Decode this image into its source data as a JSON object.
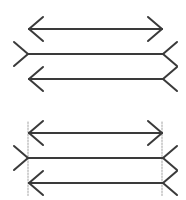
{
  "figure": {
    "stroke_color": "#3a3a3a",
    "guide_color": "#8a8a8a",
    "groups": [
      {
        "name": "illusion",
        "guides": false,
        "lines": [
          {
            "y": 29,
            "x1": 29,
            "x2": 162,
            "left": "arrow-out",
            "right": "arrow-out"
          },
          {
            "y": 54,
            "x1": 28,
            "x2": 163,
            "left": "fin-in",
            "right": "fin-in"
          },
          {
            "y": 79,
            "x1": 29,
            "x2": 163,
            "left": "arrow-out",
            "right": "fin-in"
          }
        ]
      },
      {
        "name": "reveal",
        "guides": true,
        "guide_x": [
          28,
          162
        ],
        "guide_y": [
          122,
          196
        ],
        "lines": [
          {
            "y": 133,
            "x1": 29,
            "x2": 162,
            "left": "arrow-out",
            "right": "arrow-out"
          },
          {
            "y": 158,
            "x1": 28,
            "x2": 163,
            "left": "fin-in",
            "right": "fin-in"
          },
          {
            "y": 183,
            "x1": 29,
            "x2": 163,
            "left": "arrow-out",
            "right": "fin-in"
          }
        ]
      }
    ]
  }
}
